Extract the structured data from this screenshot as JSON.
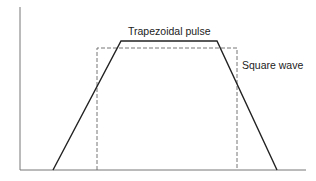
{
  "diagram": {
    "labels": {
      "trapezoid": "Trapezoidal pulse",
      "square": "Square wave"
    },
    "colors": {
      "axis": "#777777",
      "trapezoid": "#222222",
      "square": "#666666",
      "background": "#ffffff"
    },
    "axes": {
      "origin": [
        20,
        170
      ],
      "y_top": 7,
      "x_right": 306
    },
    "trapezoid_points": [
      [
        53,
        170
      ],
      [
        121,
        41
      ],
      [
        217,
        41
      ],
      [
        277,
        170
      ]
    ],
    "square_wave": {
      "left": 97,
      "right": 237,
      "top": 48,
      "bottom": 170
    }
  }
}
